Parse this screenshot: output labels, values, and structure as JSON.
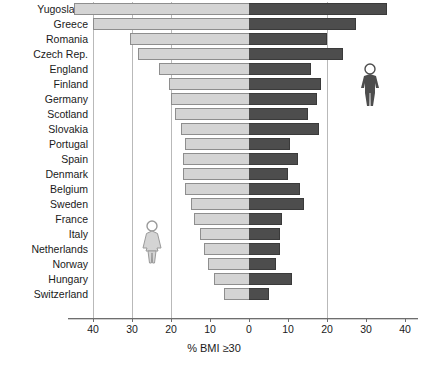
{
  "chart_data": {
    "type": "bar",
    "orientation": "horizontal-diverging",
    "title": "",
    "subtitle": "",
    "xlabel": "% BMI ≥30",
    "ylabel": "",
    "xlim": [
      -45,
      45
    ],
    "grid": true,
    "grid_axis": "x",
    "legend_position": "inside-plot",
    "axis_ticks": [
      {
        "label": "40",
        "value": -40
      },
      {
        "label": "30",
        "value": -30
      },
      {
        "label": "20",
        "value": -20
      },
      {
        "label": "10",
        "value": -10
      },
      {
        "label": "0",
        "value": 0
      },
      {
        "label": "10",
        "value": 10
      },
      {
        "label": "20",
        "value": 20
      },
      {
        "label": "30",
        "value": 30
      },
      {
        "label": "40",
        "value": 40
      }
    ],
    "gridline_values": [
      -40,
      -30,
      -20,
      20
    ],
    "categories": [
      "Yugoslavia",
      "Greece",
      "Romania",
      "Czech Rep.",
      "England",
      "Finland",
      "Germany",
      "Scotland",
      "Slovakia",
      "Portugal",
      "Spain",
      "Denmark",
      "Belgium",
      "Sweden",
      "France",
      "Italy",
      "Netherlands",
      "Norway",
      "Hungary",
      "Switzerland"
    ],
    "series": [
      {
        "name": "Women",
        "color": "#d4d4d4",
        "side": "left",
        "icon": "female-figure-icon",
        "values": [
          45.0,
          40.0,
          30.5,
          28.5,
          23.0,
          20.5,
          20.0,
          19.0,
          17.5,
          16.5,
          17.0,
          17.0,
          16.5,
          15.0,
          14.0,
          12.5,
          11.5,
          10.5,
          9.0,
          6.5
        ]
      },
      {
        "name": "Men",
        "color": "#4d4d4d",
        "side": "right",
        "icon": "male-figure-icon",
        "values": [
          35.5,
          27.5,
          20.0,
          24.0,
          16.0,
          18.5,
          17.5,
          15.0,
          18.0,
          10.5,
          12.5,
          10.0,
          13.0,
          14.0,
          8.5,
          8.0,
          8.0,
          7.0,
          11.0,
          5.0
        ]
      }
    ]
  },
  "legend": {
    "female_icon_name": "female-figure-icon",
    "male_icon_name": "male-figure-icon"
  }
}
